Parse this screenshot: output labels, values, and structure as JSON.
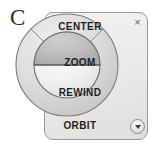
{
  "figure": {
    "label": "C"
  },
  "panel": {
    "close_icon": "×",
    "close_name": "close-icon",
    "menu_icon": "▼",
    "menu_name": "chevron-down-icon",
    "border_color": "#9a9a9a",
    "fill_color": "#ecebeb"
  },
  "wheel": {
    "name": "navigation-steering-wheel",
    "outer_ring": [
      {
        "id": "center",
        "label": "CENTER",
        "position": "top",
        "state": "normal"
      },
      {
        "id": "orbit",
        "label": "ORBIT",
        "position": "bottom",
        "state": "normal"
      }
    ],
    "inner_disc": [
      {
        "id": "zoom",
        "label": "ZOOM",
        "position": "top",
        "state": "highlighted"
      },
      {
        "id": "rewind",
        "label": "REWIND",
        "position": "bottom",
        "state": "normal"
      }
    ],
    "colors": {
      "ring_fill": "#dcdcdc",
      "inner_fill": "#f4f4f4",
      "highlight_fill": "#b8b8b8",
      "stroke": "#6f6f6f",
      "label_text": "#1f1f1f"
    }
  }
}
